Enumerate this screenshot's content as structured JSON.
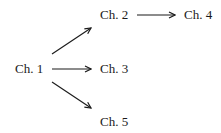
{
  "diagram": {
    "type": "directed-graph",
    "nodes": [
      {
        "id": "ch1",
        "label": "Ch. 1",
        "x": 15,
        "y": 62
      },
      {
        "id": "ch2",
        "label": "Ch. 2",
        "x": 100,
        "y": 8
      },
      {
        "id": "ch3",
        "label": "Ch. 3",
        "x": 100,
        "y": 62
      },
      {
        "id": "ch4",
        "label": "Ch. 4",
        "x": 184,
        "y": 8
      },
      {
        "id": "ch5",
        "label": "Ch. 5",
        "x": 100,
        "y": 115
      }
    ],
    "edges": [
      {
        "from": "ch1",
        "to": "ch2",
        "x1": 52,
        "y1": 54,
        "x2": 91,
        "y2": 28
      },
      {
        "from": "ch1",
        "to": "ch3",
        "x1": 52,
        "y1": 69,
        "x2": 91,
        "y2": 69
      },
      {
        "from": "ch1",
        "to": "ch5",
        "x1": 52,
        "y1": 82,
        "x2": 91,
        "y2": 108
      },
      {
        "from": "ch2",
        "to": "ch4",
        "x1": 137,
        "y1": 15,
        "x2": 175,
        "y2": 15
      }
    ],
    "colors": {
      "stroke": "#1a1a1a",
      "background": "#ffffff"
    }
  }
}
